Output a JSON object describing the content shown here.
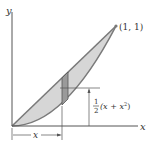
{
  "figure": {
    "axis_x_label": "x",
    "axis_y_label": "y",
    "point_label": "(1, 1)",
    "height_label_frac_num": "1",
    "height_label_frac_den": "2",
    "height_label_expr": "(x + x",
    "height_label_exp": "2",
    "height_label_close": ")",
    "distance_label": "x"
  },
  "colors": {
    "region_fill": "#d6d6d6",
    "strip_fill": "#9a9a9a",
    "curve": "#7a7a7a",
    "axis": "#555555"
  }
}
